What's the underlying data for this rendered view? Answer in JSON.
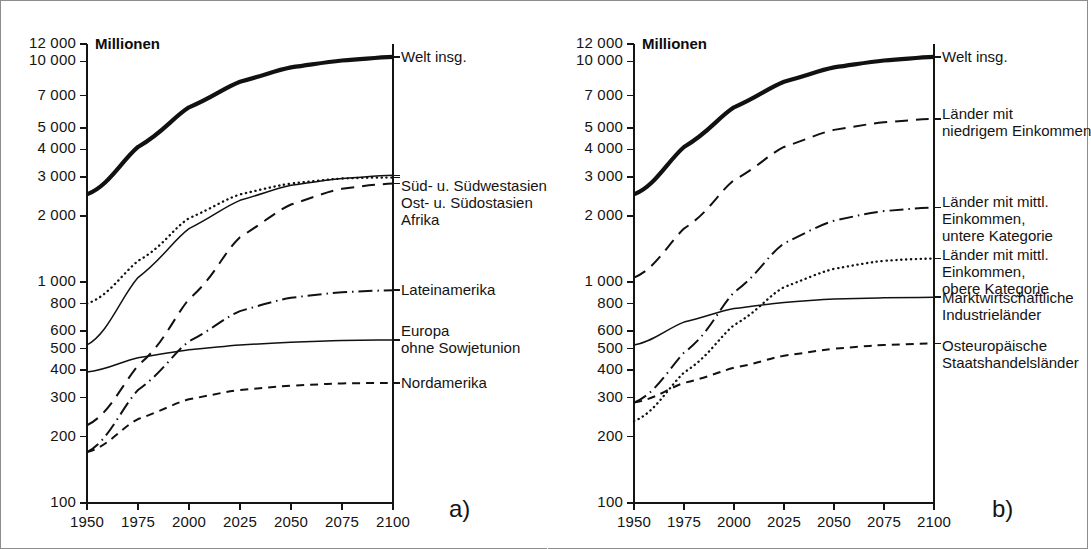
{
  "figure": {
    "background": "#ffffff",
    "frame_color": "#8d8d8d",
    "axis_color": "#141414"
  },
  "panels": [
    {
      "id": "a",
      "letter": "a)",
      "unit_label": "Millionen",
      "chart_data": {
        "type": "line",
        "title": "",
        "subtitle": "",
        "xlabel": "",
        "ylabel": "Millionen",
        "yscale": "log",
        "ylim": [
          100,
          12000
        ],
        "xlim": [
          1950,
          2100
        ],
        "grid": false,
        "legend_position": "right-of-axes",
        "ytick_labels": [
          "12 000",
          "10 000",
          "7 000",
          "5 000",
          "4 000",
          "3 000",
          "2 000",
          "1 000",
          "800",
          "600",
          "500",
          "400",
          "300",
          "200",
          "100"
        ],
        "yticks": [
          12000,
          10000,
          7000,
          5000,
          4000,
          3000,
          2000,
          1000,
          800,
          600,
          500,
          400,
          300,
          200,
          100
        ],
        "xtick_labels": [
          "1950",
          "1975",
          "2000",
          "2025",
          "2050",
          "2075",
          "2100"
        ],
        "x": [
          1950,
          1975,
          2000,
          2025,
          2050,
          2075,
          2100
        ],
        "series": [
          {
            "name": "Welt insg.",
            "label": "Welt insg.",
            "style": "solid-thick",
            "values": [
              2500,
              4100,
              6200,
              8100,
              9400,
              10100,
              10500
            ]
          },
          {
            "name": "Süd- u. Südwestasien",
            "label": "Süd- u. Südwestasien",
            "style": "dotted",
            "values": [
              800,
              1250,
              1950,
              2500,
              2800,
              2950,
              2980
            ]
          },
          {
            "name": "Ost- u. Südostasien",
            "label": "Ost- u. Südostasien",
            "style": "solid-thin",
            "values": [
              520,
              1050,
              1750,
              2350,
              2750,
              2950,
              3050
            ]
          },
          {
            "name": "Afrika",
            "label": "Afrika",
            "style": "dashed-long",
            "values": [
              225,
              420,
              840,
              1600,
              2250,
              2650,
              2800
            ]
          },
          {
            "name": "Lateinamerika",
            "label": "Lateinamerika",
            "style": "dash-dot",
            "values": [
              170,
              325,
              540,
              740,
              850,
              900,
              920
            ]
          },
          {
            "name": "Europa ohne Sowjetunion",
            "label": "Europa\nohne Sowjetunion",
            "style": "solid-thin",
            "values": [
              392,
              455,
              495,
              520,
              535,
              545,
              548
            ]
          },
          {
            "name": "Nordamerika",
            "label": "Nordamerika",
            "style": "dashed-short",
            "values": [
              170,
              240,
              295,
              325,
              340,
              348,
              350
            ]
          }
        ]
      },
      "series_labels": [
        {
          "text": "Welt insg.",
          "value_at_2100": 10500
        },
        {
          "text": "Süd- u. Südwestasien",
          "value_at_2100": 2980
        },
        {
          "text": "Ost- u. Südostasien",
          "value_at_2100": 3050
        },
        {
          "text": "Afrika",
          "value_at_2100": 2800
        },
        {
          "text": "Lateinamerika",
          "value_at_2100": 920
        },
        {
          "text": "Europa\nohne Sowjetunion",
          "value_at_2100": 548
        },
        {
          "text": "Nordamerika",
          "value_at_2100": 350
        }
      ]
    },
    {
      "id": "b",
      "letter": "b)",
      "unit_label": "Millionen",
      "chart_data": {
        "type": "line",
        "title": "",
        "subtitle": "",
        "xlabel": "",
        "ylabel": "Millionen",
        "yscale": "log",
        "ylim": [
          100,
          12000
        ],
        "xlim": [
          1950,
          2100
        ],
        "grid": false,
        "legend_position": "right-of-axes",
        "ytick_labels": [
          "12 000",
          "10 000",
          "7 000",
          "5 000",
          "4 000",
          "3 000",
          "2 000",
          "1 000",
          "800",
          "600",
          "500",
          "400",
          "300",
          "200",
          "100"
        ],
        "yticks": [
          12000,
          10000,
          7000,
          5000,
          4000,
          3000,
          2000,
          1000,
          800,
          600,
          500,
          400,
          300,
          200,
          100
        ],
        "xtick_labels": [
          "1950",
          "1975",
          "2000",
          "2025",
          "2050",
          "2075",
          "2100"
        ],
        "x": [
          1950,
          1975,
          2000,
          2025,
          2050,
          2075,
          2100
        ],
        "series": [
          {
            "name": "Welt insgesamt",
            "label": "Welt insg.",
            "style": "solid-thick",
            "values": [
              2500,
              4100,
              6200,
              8100,
              9400,
              10100,
              10500
            ]
          },
          {
            "name": "Länder mit niedrigem Einkommen",
            "label": "Länder mit\nniedrigem Einkommen",
            "style": "dashed-long",
            "values": [
              1050,
              1750,
              2900,
              4100,
              4900,
              5300,
              5500
            ]
          },
          {
            "name": "Länder mit mittl. Einkommen, untere Kategorie",
            "label": "Länder mit mittl.\nEinkommen,\nuntere Kategorie",
            "style": "dash-dot",
            "values": [
              285,
              480,
              900,
              1500,
              1900,
              2100,
              2180
            ]
          },
          {
            "name": "Länder mit mittl. Einkommen, obere Kategorie",
            "label": "Länder mit mittl.\nEinkommen,\nobere Kategorie",
            "style": "dotted",
            "values": [
              235,
              390,
              640,
              950,
              1150,
              1250,
              1280
            ]
          },
          {
            "name": "Marktwirtschaftliche Industrieländer",
            "label": "Marktwirtschaftliche\nIndustrieländer",
            "style": "solid-thin",
            "values": [
              520,
              660,
              760,
              810,
              840,
              850,
              855
            ]
          },
          {
            "name": "Osteuropäische Staatshandelsländer",
            "label": "Osteuropäische\nStaatshandelsländer",
            "style": "dashed-short",
            "values": [
              285,
              350,
              410,
              465,
              500,
              520,
              528
            ]
          }
        ]
      },
      "series_labels": [
        {
          "text": "Welt insg.",
          "value_at_2100": 10500
        },
        {
          "text": "Länder mit\nniedrigem Einkommen",
          "value_at_2100": 5500
        },
        {
          "text": "Länder mit mittl.\nEinkommen,\nuntere Kategorie",
          "value_at_2100": 2180
        },
        {
          "text": "Länder mit mittl.\nEinkommen,\nobere Kategorie",
          "value_at_2100": 1280
        },
        {
          "text": "Marktwirtschaftliche\nIndustrieländer",
          "value_at_2100": 855
        },
        {
          "text": "Osteuropäische\nStaatshandelsländer",
          "value_at_2100": 528
        }
      ]
    }
  ]
}
